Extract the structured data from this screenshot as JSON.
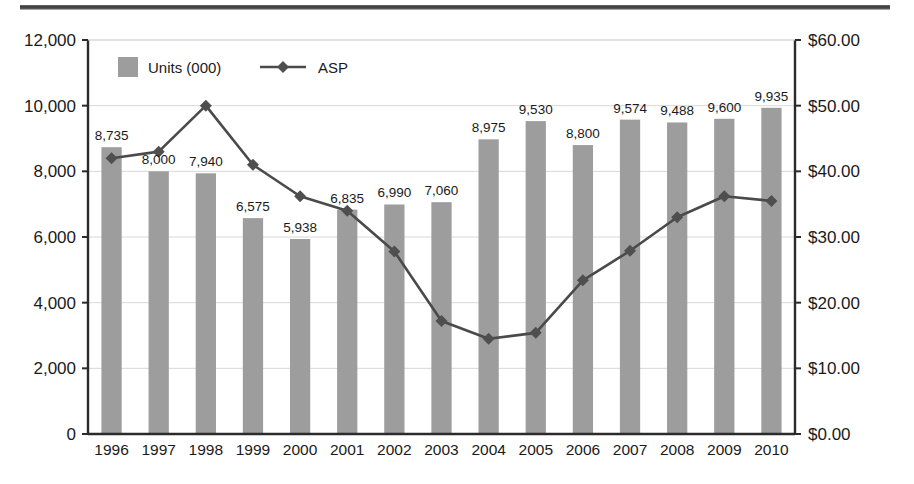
{
  "decor": {
    "top_rule_color": "#4a4a4a"
  },
  "colors": {
    "bar_fill": "#9d9d9d",
    "line_color": "#4a4a4a",
    "marker_fill": "#4f4f4f",
    "axis_color": "#2b2b2b",
    "grid_color": "#d8d8d8",
    "text_color": "#1a1a1a",
    "background": "#ffffff"
  },
  "legend": {
    "position": "inside-top-left",
    "items": [
      {
        "label": "Units (000)",
        "marker": "square-swatch"
      },
      {
        "label": "ASP",
        "marker": "line-with-diamond"
      }
    ]
  },
  "axes": {
    "left": {
      "title": "",
      "min": 0,
      "max": 12000,
      "step": 2000,
      "ticks": [
        "0",
        "2,000",
        "4,000",
        "6,000",
        "8,000",
        "10,000",
        "12,000"
      ]
    },
    "right": {
      "title": "",
      "min": 0,
      "max": 60,
      "step": 10,
      "ticks": [
        "$0.00",
        "$10.00",
        "$20.00",
        "$30.00",
        "$40.00",
        "$50.00",
        "$60.00"
      ]
    },
    "bottom": {
      "title": ""
    }
  },
  "chart_data": {
    "type": "bar",
    "title": "",
    "subtitle": "",
    "xlabel": "",
    "ylabel": "",
    "grid": true,
    "legend_position": "inside-top-left",
    "categories": [
      "1996",
      "1997",
      "1998",
      "1999",
      "2000",
      "2001",
      "2002",
      "2003",
      "2004",
      "2005",
      "2006",
      "2007",
      "2008",
      "2009",
      "2010"
    ],
    "ylim": [
      0,
      12000
    ],
    "y2lim": [
      0,
      60
    ],
    "series": [
      {
        "name": "Units (000)",
        "type": "bar",
        "axis": "left",
        "color": "#9d9d9d",
        "values": [
          8735,
          8000,
          7940,
          6575,
          5938,
          6835,
          6990,
          7060,
          8975,
          9530,
          8800,
          9574,
          9488,
          9600,
          9935
        ],
        "data_labels": [
          "8,735",
          "8,000",
          "7,940",
          "6,575",
          "5,938",
          "6,835",
          "6,990",
          "7,060",
          "8,975",
          "9,530",
          "8,800",
          "9,574",
          "9,488",
          "9,600",
          "9,935"
        ]
      },
      {
        "name": "ASP",
        "type": "line",
        "axis": "right",
        "color": "#4a4a4a",
        "marker": "diamond",
        "values": [
          42.0,
          43.0,
          50.0,
          41.0,
          36.2,
          34.0,
          27.8,
          17.2,
          14.5,
          15.4,
          23.4,
          27.9,
          33.0,
          36.2,
          35.5
        ],
        "data_labels": []
      }
    ]
  }
}
